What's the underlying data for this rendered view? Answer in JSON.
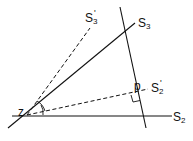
{
  "labels": {
    "s3_prime": "S",
    "s3_prime_sub": "3",
    "s3": "S",
    "s3_sub": "3",
    "s2_prime": "S",
    "s2_prime_sub": "2",
    "s2": "S",
    "s2_sub": "2",
    "p": "p",
    "z": "z",
    "prime_mark": "'"
  },
  "colors": {
    "line": "#111111",
    "background": "#ffffff"
  }
}
